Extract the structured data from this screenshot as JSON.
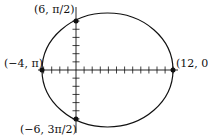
{
  "diagram": {
    "type": "polar-ellipse",
    "points": [
      {
        "label": "(6, π/2)",
        "x": 0,
        "y": 6
      },
      {
        "label": "(−4, π)",
        "x": -4,
        "y": 0
      },
      {
        "label": "(12, 0)",
        "x": 12,
        "y": 0
      },
      {
        "label": "(−6, 3π/2)",
        "x": 0,
        "y": -6
      }
    ],
    "x_ticks": {
      "min": -4,
      "max": 12,
      "step": 1
    },
    "y_ticks": {
      "min": -6,
      "max": 6,
      "step": 1
    },
    "colors": {
      "stroke": "#111111",
      "background": "#ffffff"
    }
  }
}
